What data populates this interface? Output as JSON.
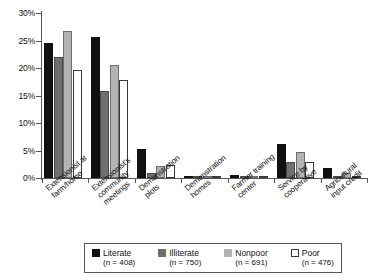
{
  "chart_data": {
    "type": "bar",
    "title": "",
    "xlabel": "",
    "ylabel": "",
    "ylim": [
      0,
      30
    ],
    "ytick_labels": [
      "0%",
      "5%",
      "10%",
      "15%",
      "20%",
      "25%",
      "30%"
    ],
    "ytick_values": [
      0,
      5,
      10,
      15,
      20,
      25,
      30
    ],
    "grid": false,
    "legend_position": "bottom",
    "categories": [
      "Extensionist at\nfarm/home",
      "Extensionist's\ncommunity\nmeetings",
      "Demonstration\nplots",
      "Demonstration\nhomes",
      "Farmer training\ncenter",
      "Service by\ncooperative",
      "Agricultural\ninput credit"
    ],
    "series": [
      {
        "name": "Literate",
        "n": 408,
        "n_label": "(n = 408)",
        "color": "#111111",
        "values": [
          24.5,
          25.7,
          5.3,
          0.2,
          0.6,
          6.2,
          1.8
        ]
      },
      {
        "name": "Illiterate",
        "n": 750,
        "n_label": "(n = 750)",
        "color": "#6f6f6f",
        "values": [
          22.0,
          15.9,
          0.9,
          0.3,
          0.2,
          2.9,
          0.2
        ]
      },
      {
        "name": "Nonpoor",
        "n": 691,
        "n_label": "(n = 691)",
        "color": "#b3b3b3",
        "values": [
          26.8,
          20.6,
          2.1,
          0.3,
          0.3,
          4.8,
          1.0
        ]
      },
      {
        "name": "Poor",
        "n": 476,
        "n_label": "(n = 476)",
        "color": "#ffffff",
        "values": [
          19.6,
          17.8,
          2.3,
          0.2,
          0.1,
          2.9,
          0.15
        ]
      }
    ]
  }
}
